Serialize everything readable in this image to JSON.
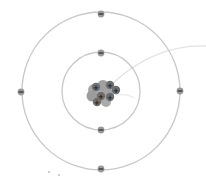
{
  "diagram": {
    "title": "Bohr model of an atom",
    "type": "atom",
    "colors": {
      "background": "#ffffff",
      "shell": "#c8c8c8",
      "pointer_line": "#e2e2e2",
      "electron": "#9a9a9a",
      "electron_sign": "#2a2a2a",
      "neutron": "#9d9d9d",
      "proton": "#6e6e6e",
      "proton_sign": "#1a1a1a"
    },
    "center": {
      "x": 101,
      "y": 91
    },
    "nucleus": {
      "label": "nucleus",
      "protons": 6,
      "neutrons": 6,
      "proton_sign": "+"
    },
    "shells": [
      {
        "label": "inner shell",
        "radius": 39,
        "electrons": 2
      },
      {
        "label": "outer shell",
        "radius": 78,
        "electrons": 4
      }
    ],
    "electron_sign": "−"
  }
}
